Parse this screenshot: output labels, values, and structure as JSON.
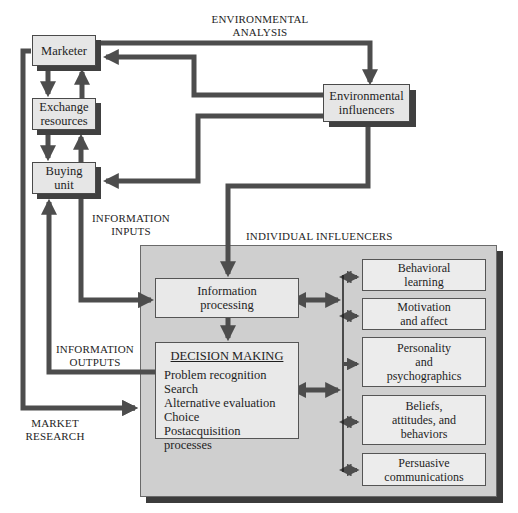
{
  "labels": {
    "environmental_analysis": [
      "ENVIRONMENTAL",
      "ANALYSIS"
    ],
    "information_inputs": [
      "INFORMATION",
      "INPUTS"
    ],
    "information_outputs": [
      "INFORMATION",
      "OUTPUTS"
    ],
    "market_research": [
      "MARKET",
      "RESEARCH"
    ],
    "individual_influencers": "INDIVIDUAL INFLUENCERS"
  },
  "nodes": {
    "marketer": [
      "Marketer"
    ],
    "exchange_resources": [
      "Exchange",
      "resources"
    ],
    "buying_unit": [
      "Buying",
      "unit"
    ],
    "environmental_influencers": [
      "Environmental",
      "influencers"
    ],
    "information_processing": [
      "Information",
      "processing"
    ],
    "decision_making": {
      "title": "DECISION MAKING",
      "items": [
        "Problem recognition",
        "Search",
        "Alternative evaluation",
        "Choice",
        "Postacquisition processes"
      ]
    },
    "individual": [
      [
        "Behavioral",
        "learning"
      ],
      [
        "Motivation",
        "and affect"
      ],
      [
        "Personality",
        "and",
        "psychographics"
      ],
      [
        "Beliefs,",
        "attitudes, and",
        "behaviors"
      ],
      [
        "Persuasive",
        "communications"
      ]
    ]
  },
  "colors": {
    "arrow": "#4d4d4d",
    "box_fill": "#e6e6e6",
    "panel_fill": "#cfcfcf",
    "shadow": "#3c3c3c"
  }
}
